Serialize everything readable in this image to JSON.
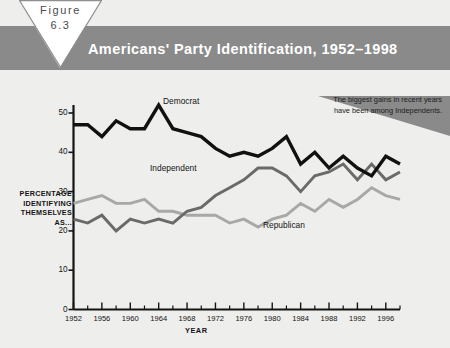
{
  "figure": {
    "badge_word": "Figure",
    "badge_number": "6.3",
    "title": "Americans' Party Identification, 1952–1998"
  },
  "callout": {
    "text": "The biggest gains in recent years have been among Independents."
  },
  "colors": {
    "band": "#8a8a8a",
    "callout_fill": "#8a8a8a",
    "page_bg": "#eeeeec",
    "democrat": "#111111",
    "independent": "#6a6a6a",
    "republican": "#a8a8a8",
    "axis": "#141414"
  },
  "chart_data": {
    "type": "line",
    "title": "Americans' Party Identification, 1952–1998",
    "xlabel": "YEAR",
    "ylabel": "PERCENTAGE IDENTIFYING THEMSELVES AS...",
    "xlim": [
      1952,
      1998
    ],
    "ylim": [
      0,
      55
    ],
    "yticks": [
      0,
      10,
      20,
      30,
      40,
      50
    ],
    "ytick_labels": [
      "0",
      "10",
      "20",
      "30",
      "40",
      "50"
    ],
    "xticks": [
      1952,
      1956,
      1960,
      1964,
      1968,
      1972,
      1976,
      1980,
      1984,
      1988,
      1992,
      1996
    ],
    "xtick_labels": [
      "1952",
      "1956",
      "1960",
      "1964",
      "1968",
      "1972",
      "1976",
      "1980",
      "1984",
      "1988",
      "1992",
      "1996"
    ],
    "minor_xticks": [
      1954,
      1958,
      1962,
      1966,
      1970,
      1974,
      1978,
      1982,
      1986,
      1990,
      1994,
      1998
    ],
    "grid": false,
    "legend": "inline-labels",
    "x": [
      1952,
      1954,
      1956,
      1958,
      1960,
      1962,
      1964,
      1966,
      1968,
      1970,
      1972,
      1974,
      1976,
      1978,
      1980,
      1982,
      1984,
      1986,
      1988,
      1990,
      1992,
      1994,
      1996,
      1998
    ],
    "series": [
      {
        "name": "Democrat",
        "color": "#111111",
        "label_x": 1964,
        "values": [
          47,
          47,
          44,
          48,
          46,
          46,
          52,
          46,
          45,
          44,
          41,
          39,
          40,
          39,
          41,
          44,
          37,
          40,
          36,
          39,
          36,
          34,
          39,
          37
        ]
      },
      {
        "name": "Independent",
        "color": "#6a6a6a",
        "label_x": 1968,
        "values": [
          23,
          22,
          24,
          20,
          23,
          22,
          23,
          22,
          25,
          26,
          29,
          31,
          33,
          36,
          36,
          34,
          30,
          34,
          35,
          37,
          33,
          37,
          33,
          35
        ]
      },
      {
        "name": "Republican",
        "color": "#a8a8a8",
        "label_x": 1982,
        "values": [
          27,
          28,
          29,
          27,
          27,
          28,
          25,
          25,
          24,
          24,
          24,
          22,
          23,
          21,
          23,
          24,
          27,
          25,
          28,
          26,
          28,
          31,
          29,
          28
        ]
      }
    ],
    "annotation": "The biggest gains in recent years have been among Independents."
  }
}
